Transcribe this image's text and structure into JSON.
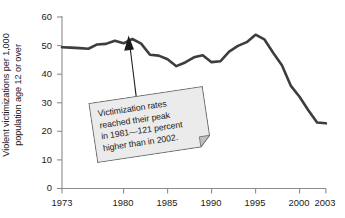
{
  "chart_data": {
    "type": "line",
    "title": "",
    "xlabel": "",
    "ylabel": "Violent victimizations per 1,000 population age 12 or over",
    "ylabel_line1": "Violent victimizations per 1,000",
    "ylabel_line2": "population age 12 or over",
    "xlim": [
      1973,
      2003
    ],
    "ylim": [
      0,
      60
    ],
    "ytick_values": [
      0,
      10,
      20,
      30,
      40,
      50,
      60
    ],
    "ytick_labels": [
      "0",
      "10",
      "20",
      "30",
      "40",
      "50",
      "60"
    ],
    "xtick_values": [
      1973,
      1980,
      1985,
      1990,
      1995,
      2000,
      2003
    ],
    "xtick_labels": [
      "1973",
      "1980",
      "1985",
      "1990",
      "1995",
      "2000",
      "2003"
    ],
    "grid": false,
    "legend": false,
    "line_color": "#3d3d3d",
    "line_width": 2.6,
    "x": [
      1973,
      1974,
      1975,
      1976,
      1977,
      1978,
      1979,
      1980,
      1981,
      1982,
      1983,
      1984,
      1985,
      1986,
      1987,
      1988,
      1989,
      1990,
      1991,
      1992,
      1993,
      1994,
      1995,
      1996,
      1997,
      1998,
      1999,
      2000,
      2001,
      2002,
      2003
    ],
    "values": [
      49.4,
      49.3,
      49.1,
      48.9,
      50.4,
      50.6,
      51.7,
      50.8,
      52.3,
      50.7,
      46.8,
      46.5,
      45.2,
      42.8,
      44.1,
      45.9,
      46.6,
      44.2,
      44.5,
      47.9,
      49.9,
      51.2,
      53.8,
      52.2,
      47.5,
      43.1,
      36.0,
      32.1,
      27.4,
      23.1,
      22.8
    ],
    "annotation": {
      "text": "Victimization rates reached their peak in 1981—121 percent higher than in 2002.",
      "lines": [
        "Victimization rates",
        "reached their peak",
        "in 1981—121 percent",
        "higher than in 2002."
      ],
      "points_to_year": 1981,
      "points_to_value": 52.3,
      "box_fill": "#ebebeb",
      "box_border": "#6e6e6e",
      "rotation_deg": -8.5
    },
    "axis_color": "#8c8c8c"
  }
}
